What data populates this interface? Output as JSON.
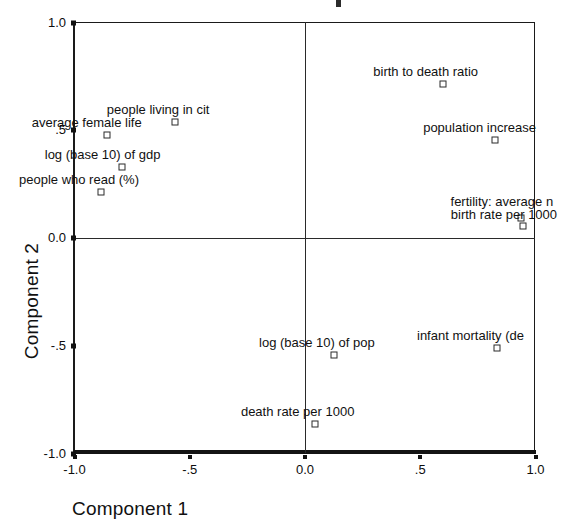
{
  "chart_data": {
    "type": "scatter",
    "xlabel": "Component 1",
    "ylabel": "Component 2",
    "xlim": [
      -1.0,
      1.0
    ],
    "ylim": [
      -1.0,
      1.0
    ],
    "grid": false,
    "legend": "none",
    "xticks": [
      "-1.0",
      "-.5",
      "0.0",
      ".5",
      "1.0"
    ],
    "xtick_values": [
      -1.0,
      -0.5,
      0.0,
      0.5,
      1.0
    ],
    "yticks": [
      "1.0",
      ".5",
      "0.0",
      "-.5",
      "-1.0"
    ],
    "ytick_values": [
      1.0,
      0.5,
      0.0,
      -0.5,
      -1.0
    ],
    "points": [
      {
        "label": "birth to death ratio",
        "x": 0.6,
        "y": 0.715
      },
      {
        "label": "population increase",
        "x": 0.825,
        "y": 0.455
      },
      {
        "label": "people living in cit",
        "x": -0.565,
        "y": 0.538
      },
      {
        "label": "average female life",
        "x": -0.86,
        "y": 0.478
      },
      {
        "label": "log (base 10) of gdp",
        "x": -0.795,
        "y": 0.33
      },
      {
        "label": "people who read (%)",
        "x": -0.885,
        "y": 0.214
      },
      {
        "label": "fertility: average n",
        "x": 0.935,
        "y": 0.093
      },
      {
        "label": "birth rate per 1000",
        "x": 0.945,
        "y": 0.056
      },
      {
        "label": "log (base 10) of pop",
        "x": 0.126,
        "y": -0.543
      },
      {
        "label": "infant mortality (de",
        "x": 0.833,
        "y": -0.511
      },
      {
        "label": "death rate per 1000",
        "x": 0.043,
        "y": -0.863
      }
    ]
  },
  "axes": {
    "x_title": "Component 1",
    "y_title": "Component 2"
  }
}
